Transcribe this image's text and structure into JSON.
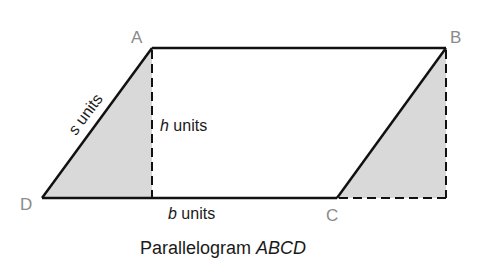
{
  "diagram": {
    "title": "Parallelogram",
    "title_italic": "ABCD",
    "vertices": {
      "A": "A",
      "B": "B",
      "C": "C",
      "D": "D"
    },
    "labels": {
      "side_var": "s",
      "side_unit": " units",
      "height_var": "h",
      "height_unit": " units",
      "base_var": "b",
      "base_unit": " units"
    },
    "colors": {
      "stroke": "#111111",
      "shade": "#d9d9d9",
      "vertex_label": "#8a8a8a"
    }
  }
}
